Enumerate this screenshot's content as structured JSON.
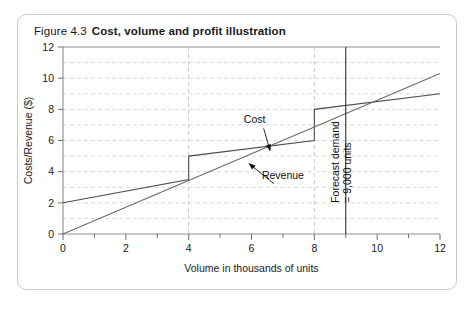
{
  "figure": {
    "number": "Figure 4.3",
    "title": "Cost, volume and profit illustration"
  },
  "chart_data": {
    "type": "line",
    "title": "Cost, volume and profit illustration",
    "xlabel": "Volume in thousands of units",
    "ylabel": "Costs/Revenue ($)",
    "xlim": [
      0,
      12
    ],
    "ylim": [
      0,
      12
    ],
    "x_ticks": [
      0,
      2,
      4,
      6,
      8,
      10,
      12
    ],
    "x_tick_labels": [
      "0",
      "2",
      "4",
      "6",
      "8",
      "10",
      "12"
    ],
    "x_minor_ticks": [
      1,
      3,
      5,
      7,
      9,
      11
    ],
    "y_ticks": [
      0,
      2,
      4,
      6,
      8,
      10,
      12
    ],
    "y_tick_labels": [
      "0",
      "2",
      "4",
      "6",
      "8",
      "10",
      "12"
    ],
    "grid": {
      "horizontal": true,
      "horizontal_step": 1,
      "vertical": true,
      "vertical_values": [
        4,
        8
      ]
    },
    "legend": "none",
    "series": [
      {
        "name": "Cost",
        "style": "stepped",
        "points": [
          [
            0,
            2.0
          ],
          [
            4,
            3.5
          ],
          [
            4,
            5.0
          ],
          [
            8,
            6.0
          ],
          [
            8,
            8.0
          ],
          [
            12,
            9.0
          ]
        ]
      },
      {
        "name": "Revenue",
        "style": "linear",
        "points": [
          [
            0,
            0.0
          ],
          [
            12,
            10.3
          ]
        ]
      }
    ],
    "annotations": [
      {
        "name": "cost",
        "text": "Cost",
        "x": 6.1,
        "y": 7.1,
        "points_to": [
          6.6,
          5.3
        ]
      },
      {
        "name": "revenue",
        "text": "Revenue",
        "x": 7.0,
        "y": 3.55,
        "points_to": [
          5.9,
          4.55
        ]
      },
      {
        "name": "forecast-demand",
        "text_line_1": "Forecast demand",
        "text_line_2": "= 9,000 units",
        "x": 9,
        "orientation": "vertical"
      }
    ],
    "markers": [
      {
        "name": "forecast-demand-line",
        "type": "vline",
        "x": 9,
        "label": "Forecast demand = 9,000 units"
      }
    ]
  },
  "colors": {
    "card_border": "#c9c9c9",
    "axis": "#8d8d8d",
    "grid": "#cfcfcf",
    "series": "#5a5a5a",
    "marker": "#2e2e2e",
    "text": "#1a1a1a"
  }
}
